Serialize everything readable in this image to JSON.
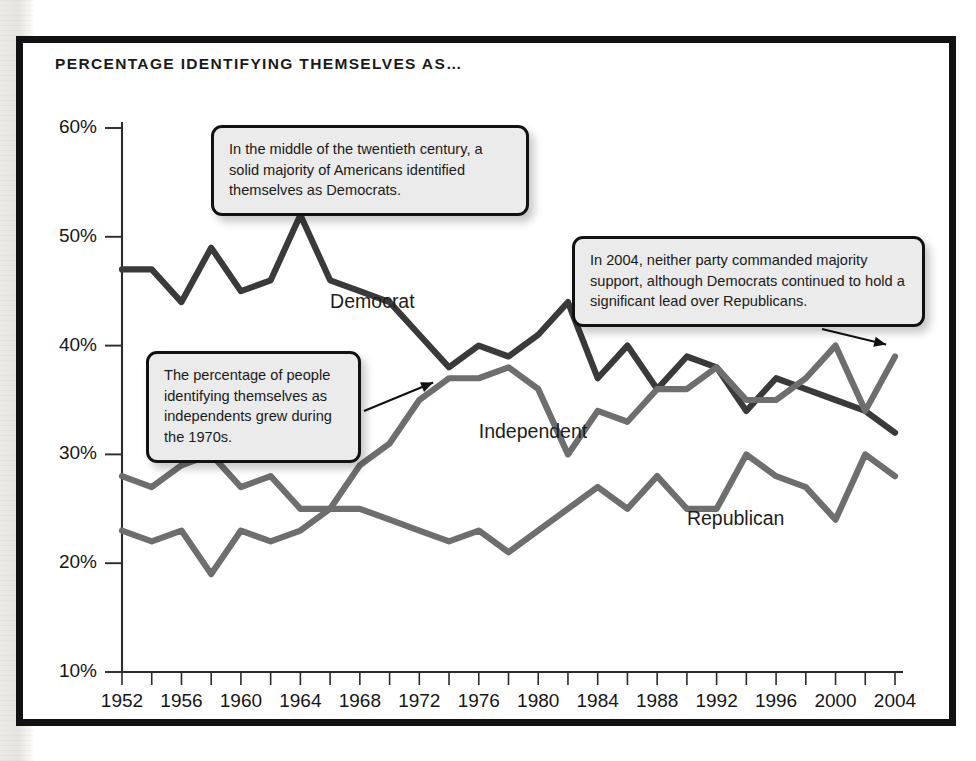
{
  "figure": {
    "title": "PERCENTAGE IDENTIFYING THEMSELVES AS…",
    "frame_color": "#111111",
    "background": "#ffffff"
  },
  "annotations": [
    {
      "id": "callout-democrat-majority",
      "text": "In the middle of the twentieth century, a solid majority of Americans identified themselves as Democrats.",
      "points_to_year": 1964,
      "points_to_value": 52
    },
    {
      "id": "callout-independent-growth",
      "text": "The percentage of people identifying themselves as independents grew during the 1970s.",
      "points_to_year": 1974,
      "points_to_value": 37
    },
    {
      "id": "callout-2004-no-majority",
      "text": "In 2004, neither party commanded majority support, although Democrats continued to hold a significant lead over Republicans.",
      "points_to_year": 2004,
      "points_to_value": 39
    }
  ],
  "chart_data": {
    "type": "line",
    "title": "PERCENTAGE IDENTIFYING THEMSELVES AS…",
    "xlabel": "",
    "ylabel": "",
    "xlim": [
      1952,
      2004
    ],
    "ylim": [
      10,
      60
    ],
    "grid": false,
    "legend": "inline-labels",
    "y_tick_values": [
      10,
      20,
      30,
      40,
      50,
      60
    ],
    "y_tick_labels": [
      "10%",
      "20%",
      "30%",
      "40%",
      "50%",
      "60%"
    ],
    "x_tick_values": [
      1952,
      1954,
      1956,
      1958,
      1960,
      1962,
      1964,
      1966,
      1968,
      1970,
      1972,
      1974,
      1976,
      1978,
      1980,
      1982,
      1984,
      1986,
      1988,
      1990,
      1992,
      1994,
      1996,
      1998,
      2000,
      2002,
      2004
    ],
    "x_tick_labels_every": 4,
    "x_labeled_ticks": [
      1952,
      1956,
      1960,
      1964,
      1968,
      1972,
      1976,
      1980,
      1984,
      1988,
      1992,
      1996,
      2000,
      2004
    ],
    "x": [
      1952,
      1954,
      1956,
      1958,
      1960,
      1962,
      1964,
      1966,
      1968,
      1970,
      1972,
      1974,
      1976,
      1978,
      1980,
      1982,
      1984,
      1986,
      1988,
      1990,
      1992,
      1994,
      1996,
      1998,
      2000,
      2002,
      2004
    ],
    "series": [
      {
        "name": "Democrat",
        "color": "#3a3a3a",
        "label_x": 1966,
        "label_y": 43.5,
        "values": [
          47,
          47,
          44,
          49,
          45,
          46,
          52,
          46,
          45,
          44,
          41,
          38,
          40,
          39,
          41,
          44,
          37,
          40,
          36,
          39,
          38,
          34,
          37,
          36,
          35,
          34,
          32
        ]
      },
      {
        "name": "Independent",
        "color": "#6e6e6e",
        "label_x": 1976,
        "label_y": 31.5,
        "values": [
          23,
          22,
          23,
          19,
          23,
          22,
          23,
          25,
          29,
          31,
          35,
          37,
          37,
          38,
          36,
          30,
          34,
          33,
          36,
          36,
          38,
          35,
          35,
          37,
          40,
          34,
          39
        ]
      },
      {
        "name": "Republican",
        "color": "#6e6e6e",
        "label_x": 1990,
        "label_y": 23.5,
        "values": [
          28,
          27,
          29,
          30,
          27,
          28,
          25,
          25,
          25,
          24,
          23,
          22,
          23,
          21,
          23,
          25,
          27,
          25,
          28,
          25,
          25,
          30,
          28,
          27,
          24,
          30,
          28
        ]
      }
    ]
  }
}
